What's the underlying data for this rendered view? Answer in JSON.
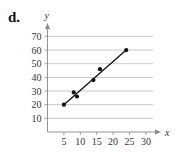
{
  "panel_label": "d.",
  "chart_data": {
    "type": "scatter",
    "title": "",
    "xlabel": "x",
    "ylabel": "y",
    "xlim": [
      0,
      32
    ],
    "ylim": [
      0,
      75
    ],
    "x_ticks": [
      5,
      10,
      15,
      20,
      25,
      30
    ],
    "y_ticks": [
      10,
      20,
      30,
      40,
      50,
      60,
      70
    ],
    "grid": "horizontal",
    "points": [
      {
        "x": 5,
        "y": 20
      },
      {
        "x": 8,
        "y": 29
      },
      {
        "x": 9,
        "y": 26
      },
      {
        "x": 14,
        "y": 38
      },
      {
        "x": 16,
        "y": 46
      },
      {
        "x": 24,
        "y": 60
      }
    ],
    "trend_line": {
      "from": {
        "x": 5,
        "y": 20
      },
      "to": {
        "x": 24,
        "y": 60
      }
    },
    "colors": {
      "points": "#111111",
      "line": "#111111",
      "grid": "#bbbbbb",
      "axis": "#888888"
    }
  }
}
